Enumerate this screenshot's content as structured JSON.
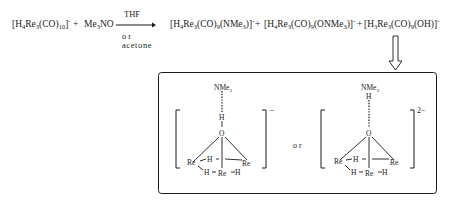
{
  "reaction": {
    "reactant1": {
      "formula": "[H4Re3(CO)10]-",
      "parts": [
        "[H",
        "4",
        "Re",
        "3",
        "(CO)",
        "10",
        "]",
        "-"
      ]
    },
    "plus1": "+",
    "reactant2": {
      "formula": "Me3NO",
      "parts": [
        "Me",
        "3",
        "NO"
      ]
    },
    "arrow": {
      "above": "THF",
      "below_line1": "or",
      "below_line2": "acetone"
    },
    "product1": {
      "formula": "[H4Re3(CO)9(NMe3)]-",
      "parts": [
        "[H",
        "4",
        "Re",
        "3",
        "(CO)",
        "9",
        "(NMe",
        "3",
        ")]",
        "-"
      ]
    },
    "plus2": "+",
    "product2": {
      "formula": "[H4Re3(CO)9(ONMe3)]-",
      "parts": [
        "[H",
        "4",
        "Re",
        "3",
        "(CO)",
        "9",
        "(ONMe",
        "3",
        ")]",
        "-"
      ]
    },
    "plus3": "+",
    "product3": {
      "formula": "[H3Re3(CO)9(OH)]-",
      "parts": [
        "[H",
        "3",
        "Re",
        "3",
        "(CO)",
        "9",
        "(OH)]",
        "-"
      ]
    }
  },
  "box": {
    "connector": "or",
    "structure1": {
      "charge": "−",
      "labels": {
        "nme3": "NMe3",
        "h_top": "H",
        "o": "O",
        "re_left": "Re",
        "re_right": "Re",
        "re_bottom": "Re",
        "h_bridge_top": "H",
        "h_bridge_left": "H",
        "h_bridge_right": "H"
      }
    },
    "structure2": {
      "charge": "2−",
      "labels": {
        "nme3": "NMe3",
        "h_top": "H",
        "o": "O",
        "re_left": "Re",
        "re_right": "Re",
        "re_bottom": "Re",
        "h_bridge_top": "H",
        "h_bridge_left": "H",
        "h_bridge_right": "H"
      }
    }
  }
}
